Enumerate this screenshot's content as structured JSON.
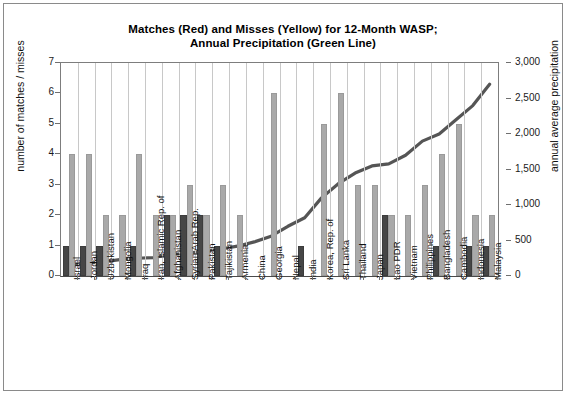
{
  "chart_data": {
    "type": "bar",
    "title": "Matches (Red) and Misses (Yellow) for 12-Month WASP; Annual Precipitation (Green Line)",
    "title_line1": "Matches (Red) and Misses (Yellow) for 12-Month WASP;",
    "title_line2": "Annual Precipitation (Green Line)",
    "xlabel": "",
    "ylabel": "number of matches / misses",
    "ylabel_secondary": "annual average precipitation",
    "ylim": [
      0,
      7
    ],
    "ylim_secondary": [
      0,
      3000
    ],
    "yticks": [
      0,
      1,
      2,
      3,
      4,
      5,
      6,
      7
    ],
    "yticks_secondary_labels": [
      "0",
      "500",
      "1,000",
      "1,500",
      "2,000",
      "2,500",
      "3,000"
    ],
    "yticks_secondary": [
      0,
      500,
      1000,
      1500,
      2000,
      2500,
      3000
    ],
    "grid": "vertical",
    "legend_position": "none",
    "categories": [
      "Israel",
      "Jordan",
      "Uzbekistan",
      "Mongolia",
      "Iraq",
      "Iran, Islamic Rep. of",
      "Afghanistan",
      "Syrian Arab Rep.",
      "Pakistan",
      "Tajikistan",
      "Armenia",
      "China",
      "Georgia",
      "Nepal",
      "India",
      "Korea, Rep. of",
      "Sri Lanka",
      "Thailand",
      "Japan",
      "Lao PDR",
      "Vietnam",
      "Philippines",
      "Bangladesh",
      "Cambodia",
      "Indonesia",
      "Malaysia"
    ],
    "series": [
      {
        "name": "Matches (Red)",
        "color": "#464646",
        "values": [
          1,
          1,
          1,
          0,
          1,
          0,
          2,
          2,
          2,
          1,
          0,
          0,
          0,
          0,
          1,
          0,
          0,
          0,
          0,
          2,
          0,
          0,
          1,
          0,
          1,
          1
        ]
      },
      {
        "name": "Misses (Yellow)",
        "color": "#a9a9a9",
        "values": [
          4,
          4,
          2,
          2,
          4,
          2,
          2,
          3,
          2,
          3,
          2,
          0,
          6,
          0,
          0,
          5,
          6,
          3,
          3,
          2,
          2,
          3,
          4,
          5,
          2,
          2
        ]
      },
      {
        "name": "Annual Precipitation (Green Line)",
        "color": "#555555",
        "axis": "secondary",
        "values": [
          150,
          180,
          200,
          230,
          250,
          260,
          300,
          320,
          350,
          380,
          420,
          480,
          560,
          700,
          820,
          1100,
          1300,
          1450,
          1550,
          1580,
          1700,
          1900,
          2000,
          2200,
          2400,
          2700
        ]
      }
    ]
  },
  "axis": {
    "left_label": "number of matches / misses",
    "right_label": "annual average precipitation"
  }
}
